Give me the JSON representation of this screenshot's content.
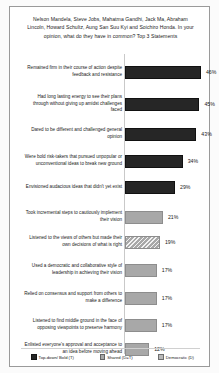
{
  "chart_data": {
    "type": "bar",
    "orientation": "horizontal",
    "title": "Nelson Mandela, Steve Jobs, Mahatma Gandhi, Jack Ma, Abraham Lincoln, Howard Schultz, Aung San Suu Kyi and Soichiro Honda. In your opinion, what do they have in common? Top 3 Statements",
    "xlabel": "",
    "ylabel": "",
    "xlim": [
      0,
      50
    ],
    "grid": false,
    "legend_position": "bottom",
    "categories": [
      "Remained firm in their course of action despite feedback and resistance",
      "Had long lasting energy to see their plans through without giving up amidst challenges faced",
      "Dared to be different and challenged general opinion",
      "Were bold risk-takers that pursued unpopular or unconventional ideas to break new ground",
      "Envisioned audacious  ideas that didn't yet exist",
      "Took incremental steps to cautiously implement their vision",
      "Listened to the views of others but made their own decisions of what is right",
      "Used a democratic and collaborative style of leadership  in achieving their vision",
      "Relied on consensus and support from others to make a difference",
      "Listened to find middle ground in the face of opposing viewpoints  to preserve harmony",
      "Enlisted everyone's approval and acceptance to an idea before moving ahead"
    ],
    "values": [
      46,
      45,
      43,
      34,
      29,
      21,
      19,
      17,
      17,
      17,
      12
    ],
    "value_labels": [
      "46%",
      "45%",
      "43%",
      "34%",
      "29%",
      "21%",
      "19%",
      "17%",
      "17%",
      "17%",
      "12%"
    ],
    "styles": [
      "dark",
      "dark",
      "dark",
      "dark",
      "dark",
      "gray",
      "hatch",
      "gray",
      "gray",
      "gray",
      "gray"
    ],
    "legend": [
      {
        "label": "Top-down/ Bold (T)",
        "style": "dark"
      },
      {
        "label": "Shared (D=T)",
        "style": "hatch"
      },
      {
        "label": "Democratic (D)",
        "style": "gray"
      }
    ],
    "colors": {
      "dark": "#262626",
      "gray": "#a8a8a8",
      "hatch": "#a8a8a8",
      "frame": "#9a9a9a",
      "axis": "#c9c9c9",
      "text": "#1a1a1a"
    }
  }
}
